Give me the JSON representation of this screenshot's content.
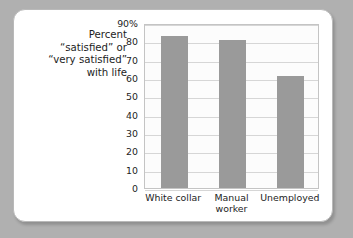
{
  "chart_data": {
    "type": "bar",
    "title": "",
    "subtitle": "",
    "xlabel": "",
    "ylabel": "Percent “satisfied” or “very satisfied” with life",
    "ylabel_lines": [
      "Percent",
      "“satisfied” or",
      "“very satisfied”",
      "with life"
    ],
    "categories": [
      "White collar",
      "Manual worker",
      "Unemployed"
    ],
    "category_label_lines": [
      [
        "White collar"
      ],
      [
        "Manual",
        "worker"
      ],
      [
        "Unemployed"
      ]
    ],
    "values": [
      83,
      81,
      61
    ],
    "ylim": [
      0,
      90
    ],
    "yticks": [
      0,
      10,
      20,
      30,
      40,
      50,
      60,
      70,
      80,
      90
    ],
    "ytick_labels": [
      "0",
      "10",
      "20",
      "30",
      "40",
      "50",
      "60",
      "70",
      "80",
      "90%"
    ],
    "grid": true,
    "legend": false,
    "legend_position": "none",
    "colors": {
      "bar": "#9a9a9a",
      "plot_background": "#fcfcfc",
      "gridline": "#d6d6d6",
      "plot_border": "#c4c4c4",
      "card_background": "#ffffff",
      "card_border": "#b9b9b9",
      "page_background": "#b0b0b0",
      "text": "#1d1d1d"
    }
  }
}
